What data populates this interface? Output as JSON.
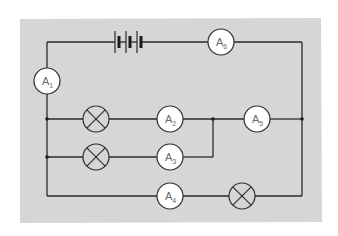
{
  "diagram": {
    "type": "circuit",
    "colors": {
      "background": "#ffffff",
      "panel": "#d6d6d6",
      "wire": "#2a2a2a",
      "meter_fill": "#ffffff",
      "label": "#6a6a6a"
    },
    "battery": {
      "cells": 3
    },
    "ammeters": [
      {
        "id": "A1",
        "letter": "A",
        "sub": "1",
        "cx": 47,
        "cy": 81
      },
      {
        "id": "A2",
        "letter": "A",
        "sub": "2",
        "cx": 170,
        "cy": 119
      },
      {
        "id": "A3",
        "letter": "A",
        "sub": "3",
        "cx": 170,
        "cy": 157
      },
      {
        "id": "A4",
        "letter": "A",
        "sub": "4",
        "cx": 170,
        "cy": 196
      },
      {
        "id": "A5",
        "letter": "A",
        "sub": "5",
        "cx": 257,
        "cy": 119
      },
      {
        "id": "A6",
        "letter": "A",
        "sub": "6",
        "cx": 221,
        "cy": 42
      }
    ],
    "lamps": [
      {
        "id": "lamp-1",
        "cx": 96,
        "cy": 119
      },
      {
        "id": "lamp-2",
        "cx": 96,
        "cy": 157
      },
      {
        "id": "lamp-3",
        "cx": 242,
        "cy": 196
      }
    ]
  }
}
